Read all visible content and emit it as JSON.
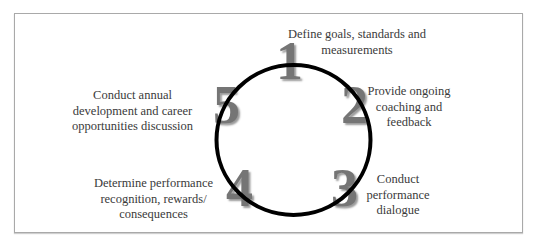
{
  "diagram": {
    "type": "cycle",
    "colors": {
      "ring": "#000000",
      "digit": "#757575",
      "text": "#3a3a3a",
      "border": "#a9a9a9"
    },
    "steps": [
      {
        "number": "1",
        "lines": [
          "Define goals, standards and",
          "measurements"
        ]
      },
      {
        "number": "2",
        "lines": [
          "Provide ongoing",
          "coaching and",
          "feedback"
        ]
      },
      {
        "number": "3",
        "lines": [
          "Conduct",
          "performance",
          "dialogue"
        ]
      },
      {
        "number": "4",
        "lines": [
          "Determine performance",
          "recognition, rewards/",
          "consequences"
        ]
      },
      {
        "number": "5",
        "lines": [
          "Conduct annual",
          "development and career",
          "opportunities discussion"
        ]
      }
    ]
  }
}
